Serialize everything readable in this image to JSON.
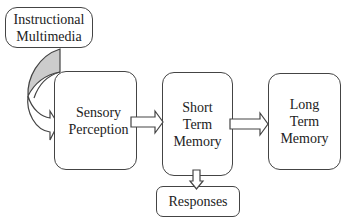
{
  "diagram": {
    "nodes": [
      {
        "id": "instructional",
        "label": "Instructional\nMultimedia"
      },
      {
        "id": "sensory",
        "label": "Sensory\nPerception"
      },
      {
        "id": "short_term",
        "label": "Short\nTerm\nMemory"
      },
      {
        "id": "long_term",
        "label": "Long\nTerm\nMemory"
      },
      {
        "id": "responses",
        "label": "Responses"
      }
    ],
    "edges": [
      {
        "from": "instructional",
        "to": "sensory",
        "style": "curved-block-arrow"
      },
      {
        "from": "sensory",
        "to": "short_term",
        "style": "block-arrow"
      },
      {
        "from": "short_term",
        "to": "long_term",
        "style": "block-arrow"
      },
      {
        "from": "short_term",
        "to": "responses",
        "style": "block-arrow-down"
      }
    ],
    "colors": {
      "stroke": "#444444",
      "curve_fill": "#cccccc",
      "background": "#ffffff"
    }
  }
}
